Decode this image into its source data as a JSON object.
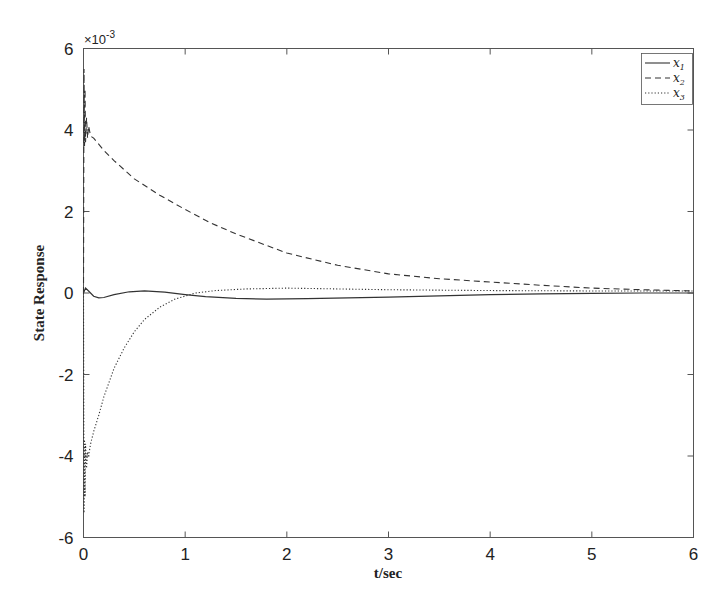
{
  "chart_data": {
    "type": "line",
    "title": "",
    "xlabel": "t/sec",
    "ylabel": "State Response",
    "y_exponent_label": "×10",
    "y_exponent_power": "-3",
    "xlim": [
      0,
      6
    ],
    "ylim": [
      -6,
      6
    ],
    "x_ticks": [
      0,
      1,
      2,
      3,
      4,
      5,
      6
    ],
    "x_tick_labels": [
      "0",
      "1",
      "2",
      "3",
      "4",
      "5",
      "6"
    ],
    "y_ticks": [
      -6,
      -4,
      -2,
      0,
      2,
      4,
      6
    ],
    "y_tick_labels": [
      "-6",
      "-4",
      "-2",
      "0",
      "2",
      "4",
      "6"
    ],
    "grid": false,
    "legend_position": "upper right",
    "series": [
      {
        "name": "x1",
        "label_main": "x",
        "label_sub": "1",
        "style": "solid",
        "color": "#333333",
        "x": [
          0,
          0.02,
          0.05,
          0.1,
          0.15,
          0.2,
          0.3,
          0.45,
          0.6,
          0.8,
          1.0,
          1.2,
          1.5,
          1.8,
          2.2,
          2.6,
          3.0,
          3.5,
          4.0,
          4.5,
          5.0,
          5.5,
          6.0
        ],
        "values": [
          0.0,
          0.12,
          0.05,
          -0.08,
          -0.12,
          -0.11,
          -0.04,
          0.03,
          0.05,
          0.02,
          -0.04,
          -0.09,
          -0.13,
          -0.15,
          -0.14,
          -0.12,
          -0.1,
          -0.07,
          -0.04,
          -0.02,
          -0.01,
          0.0,
          0.0
        ]
      },
      {
        "name": "x2",
        "label_main": "x",
        "label_sub": "2",
        "style": "dashed",
        "color": "#333333",
        "x": [
          0,
          0.005,
          0.01,
          0.015,
          0.02,
          0.03,
          0.04,
          0.05,
          0.07,
          0.1,
          0.2,
          0.3,
          0.5,
          0.75,
          1.0,
          1.25,
          1.5,
          2.0,
          2.5,
          3.0,
          3.5,
          4.0,
          4.5,
          5.0,
          5.5,
          6.0
        ],
        "values": [
          0.0,
          5.5,
          3.6,
          5.0,
          3.7,
          4.3,
          3.8,
          4.1,
          3.85,
          3.8,
          3.5,
          3.25,
          2.8,
          2.4,
          2.05,
          1.72,
          1.45,
          0.98,
          0.68,
          0.47,
          0.35,
          0.27,
          0.19,
          0.12,
          0.08,
          0.05
        ]
      },
      {
        "name": "x3",
        "label_main": "x",
        "label_sub": "3",
        "style": "dotted",
        "color": "#333333",
        "x": [
          0,
          0.005,
          0.01,
          0.015,
          0.02,
          0.03,
          0.04,
          0.05,
          0.07,
          0.1,
          0.15,
          0.2,
          0.3,
          0.4,
          0.5,
          0.6,
          0.75,
          0.9,
          1.1,
          1.3,
          1.6,
          2.0,
          2.5,
          3.0,
          4.0,
          5.0,
          6.0
        ],
        "values": [
          0.0,
          -5.4,
          -3.6,
          -5.0,
          -3.7,
          -4.3,
          -3.9,
          -4.0,
          -3.7,
          -3.4,
          -3.0,
          -2.55,
          -1.85,
          -1.35,
          -0.95,
          -0.65,
          -0.35,
          -0.15,
          0.0,
          0.06,
          0.1,
          0.12,
          0.1,
          0.08,
          0.06,
          0.05,
          0.05
        ]
      }
    ]
  }
}
